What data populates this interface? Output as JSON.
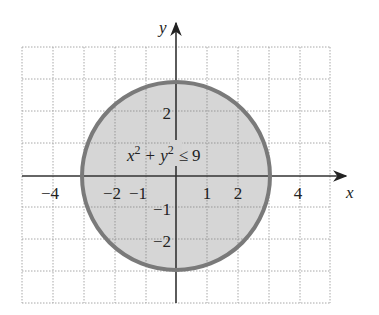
{
  "figure": {
    "type": "region-graph",
    "axes": {
      "x_label": "x",
      "y_label": "y",
      "x_ticks": [
        {
          "value": -4,
          "label": "−4"
        },
        {
          "value": -2,
          "label": "−2"
        },
        {
          "value": -1,
          "label": "−1"
        },
        {
          "value": 1,
          "label": "1"
        },
        {
          "value": 2,
          "label": "2"
        },
        {
          "value": 4,
          "label": "4"
        }
      ],
      "y_ticks": [
        {
          "value": 2,
          "label": "2"
        },
        {
          "value": -1,
          "label": "−1"
        },
        {
          "value": -2,
          "label": "−2"
        }
      ],
      "grid": {
        "x_range": [
          -5,
          5
        ],
        "y_range": [
          -4,
          4
        ],
        "step": 1,
        "style": "dotted"
      }
    },
    "region": {
      "shape": "disk",
      "center": [
        0,
        0
      ],
      "radius": 3,
      "inequality": {
        "lhs_x": "x",
        "exp": "2",
        "plus": "+",
        "lhs_y": "y",
        "rel": "≤",
        "rhs": "9"
      }
    },
    "colors": {
      "fill": "#d4d4d4",
      "boundary": "#7a7a7a",
      "grid": "#a8a8a8",
      "axis": "#333333"
    }
  }
}
